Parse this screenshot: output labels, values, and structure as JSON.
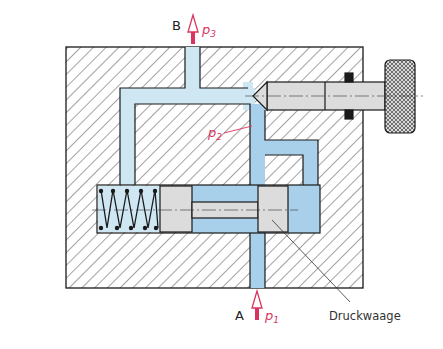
{
  "diagram": {
    "type": "hydraulic flow control valve cross-section",
    "labels": {
      "port_b": "B",
      "port_a": "A",
      "p1": "p",
      "p1_sub": "1",
      "p2": "p",
      "p2_sub": "2",
      "p3": "p",
      "p3_sub": "3",
      "druckwaage": "Druckwaage"
    },
    "colors": {
      "outline": "#1a1a1a",
      "hatch": "#333333",
      "light_fluid": "#cfe6f3",
      "dark_fluid": "#a9d0ea",
      "metal": "#dcdcdc",
      "pressure_accent": "#d8345f",
      "knob": "#cfcfcf"
    }
  }
}
